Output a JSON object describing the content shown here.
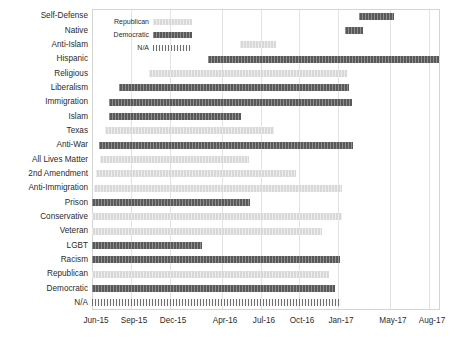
{
  "chart_data": {
    "type": "bar",
    "subtype": "gantt-horizontal-range",
    "title": "",
    "subtitle": "",
    "xlabel": "",
    "ylabel": "",
    "grid": true,
    "legend_position": "inside-top-left",
    "x_axis": {
      "tick_labels": [
        "Jun-15",
        "Sep-15",
        "Dec-15",
        "Apr-16",
        "Jul-16",
        "Oct-16",
        "Jan-17",
        "May-17",
        "Aug-17"
      ],
      "tick_values": [
        2015.42,
        2015.67,
        2015.92,
        2016.25,
        2016.5,
        2016.75,
        2017.0,
        2017.33,
        2017.58
      ],
      "xlim": [
        "Jun-15",
        "Sep-17"
      ],
      "xlim_values": [
        2015.42,
        2017.67
      ]
    },
    "categories": [
      "Self-Defense",
      "Native",
      "Anti-Islam",
      "Hispanic",
      "Religious",
      "Liberalism",
      "Immigration",
      "Islam",
      "Texas",
      "Anti-War",
      "All Lives Matter",
      "2nd Amendment",
      "Anti-Immigration",
      "Prison",
      "Conservative",
      "Veteran",
      "LGBT",
      "Racism",
      "Republican",
      "Democratic",
      "N/A"
    ],
    "legend": [
      {
        "label": "Republican",
        "color": "#d8d8d8",
        "key": "rep"
      },
      {
        "label": "Democratic",
        "color": "#595959",
        "key": "dem"
      },
      {
        "label": "N/A",
        "color": "#b9b9b9",
        "key": "na"
      }
    ],
    "colors": {
      "democratic": "#595959",
      "republican": "#d8d8d8",
      "na": "#b9b9b9",
      "mid": "#9d9d9d",
      "grid": "#e3e3e3",
      "frame": "#d4d4d4",
      "text": "#2b2b2b"
    },
    "bars": [
      {
        "category": "Self-Defense",
        "series": "dem",
        "start": "Dec-16",
        "end": "Mar-17",
        "start_px": 267,
        "width_px": 35
      },
      {
        "category": "Native",
        "series": "dem",
        "start": "Nov-16",
        "end": "Jan-17",
        "start_px": 253,
        "width_px": 18
      },
      {
        "category": "Anti-Islam",
        "series": "rep",
        "start": "Mar-16",
        "end": "Jun-16",
        "start_px": 148,
        "width_px": 36
      },
      {
        "category": "Hispanic",
        "series": "dem",
        "start": "Mar-16",
        "end": "Sep-17",
        "start_px": 116,
        "width_px": 231
      },
      {
        "category": "Religious",
        "series": "rep",
        "start": "Jan-16",
        "end": "Mar-17",
        "start_px": 57,
        "width_px": 198
      },
      {
        "category": "Liberalism",
        "series": "dem",
        "start": "Oct-15",
        "end": "Mar-17",
        "start_px": 27,
        "width_px": 230
      },
      {
        "category": "Immigration",
        "series": "dem",
        "start": "Sep-15",
        "end": "Apr-17",
        "start_px": 17,
        "width_px": 243
      },
      {
        "category": "Islam",
        "series": "dem",
        "start": "Sep-15",
        "end": "Jul-16",
        "start_px": 17,
        "width_px": 132
      },
      {
        "category": "Texas",
        "series": "rep",
        "start": "Aug-15",
        "end": "Mar-16",
        "start_px": 13,
        "width_px": 169
      },
      {
        "category": "Anti-War",
        "series": "dem",
        "start": "Jul-15",
        "end": "Apr-17",
        "start_px": 7,
        "width_px": 254
      },
      {
        "category": "All Lives Matter",
        "series": "rep",
        "start": "Jul-15",
        "end": "Jan-16",
        "start_px": 8,
        "width_px": 149
      },
      {
        "category": "2nd Amendment",
        "series": "rep",
        "start": "Jun-15",
        "end": "Feb-17",
        "start_px": 4,
        "width_px": 200
      },
      {
        "category": "Anti-Immigration",
        "series": "rep",
        "start": "Jun-15",
        "end": "Sep-17",
        "start_px": 2,
        "width_px": 248
      },
      {
        "category": "Prison",
        "series": "dem",
        "start": "Jun-15",
        "end": "Dec-16",
        "start_px": 0,
        "width_px": 158
      },
      {
        "category": "Conservative",
        "series": "rep",
        "start": "Jun-15",
        "end": "Jun-17",
        "start_px": 0,
        "width_px": 250
      },
      {
        "category": "Veteran",
        "series": "rep",
        "start": "Jun-15",
        "end": "Apr-17",
        "start_px": 0,
        "width_px": 230
      },
      {
        "category": "LGBT",
        "series": "dem",
        "start": "Jun-15",
        "end": "Jun-16",
        "start_px": 0,
        "width_px": 110
      },
      {
        "category": "Racism",
        "series": "dem",
        "start": "Jun-15",
        "end": "Jul-17",
        "start_px": 0,
        "width_px": 248
      },
      {
        "category": "Republican",
        "series": "rep",
        "start": "Jun-15",
        "end": "May-17",
        "start_px": 0,
        "width_px": 237
      },
      {
        "category": "Democratic",
        "series": "dem",
        "start": "Jun-15",
        "end": "May-17",
        "start_px": 0,
        "width_px": 243
      },
      {
        "category": "N/A",
        "series": "na",
        "start": "Jun-15",
        "end": "Aug-17",
        "start_px": 0,
        "width_px": 249
      }
    ]
  }
}
